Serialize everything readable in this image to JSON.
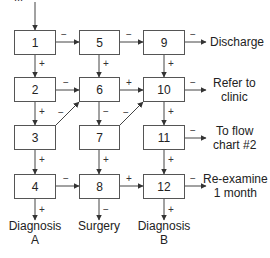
{
  "diagram": {
    "type": "flowchart",
    "top_text_partial": "...",
    "boxes": [
      {
        "id": "1",
        "label": "1"
      },
      {
        "id": "2",
        "label": "2"
      },
      {
        "id": "3",
        "label": "3"
      },
      {
        "id": "4",
        "label": "4"
      },
      {
        "id": "5",
        "label": "5"
      },
      {
        "id": "6",
        "label": "6"
      },
      {
        "id": "7",
        "label": "7"
      },
      {
        "id": "8",
        "label": "8"
      },
      {
        "id": "9",
        "label": "9"
      },
      {
        "id": "10",
        "label": "10"
      },
      {
        "id": "11",
        "label": "11"
      },
      {
        "id": "12",
        "label": "12"
      }
    ],
    "outcomes": {
      "discharge": "Discharge",
      "refer_line1": "Refer to",
      "refer_line2": "clinic",
      "flow_line1": "To flow",
      "flow_line2": "chart #2",
      "reexamine_line1": "Re-examine",
      "reexamine_line2": "1 month",
      "diag_a_line1": "Diagnosis",
      "diag_a_line2": "A",
      "surgery": "Surgery",
      "diag_b_line1": "Diagnosis",
      "diag_b_line2": "B"
    },
    "edges": [
      {
        "from": "start",
        "to": "1",
        "sign": ""
      },
      {
        "from": "1",
        "to": "5",
        "sign": "−"
      },
      {
        "from": "1",
        "to": "2",
        "sign": "+"
      },
      {
        "from": "5",
        "to": "9",
        "sign": "−"
      },
      {
        "from": "5",
        "to": "6",
        "sign": "+"
      },
      {
        "from": "9",
        "to": "Discharge",
        "sign": "−"
      },
      {
        "from": "9",
        "to": "10",
        "sign": "+"
      },
      {
        "from": "2",
        "to": "6",
        "sign": "−"
      },
      {
        "from": "2",
        "to": "3",
        "sign": "+"
      },
      {
        "from": "6",
        "to": "10",
        "sign": "+"
      },
      {
        "from": "6",
        "to": "7",
        "sign": "−"
      },
      {
        "from": "10",
        "to": "Refer to clinic",
        "sign": "−"
      },
      {
        "from": "10",
        "to": "11",
        "sign": "+"
      },
      {
        "from": "3",
        "to": "6",
        "sign": "−"
      },
      {
        "from": "3",
        "to": "4",
        "sign": "+"
      },
      {
        "from": "7",
        "to": "10",
        "sign": "−"
      },
      {
        "from": "7",
        "to": "8",
        "sign": "+"
      },
      {
        "from": "11",
        "to": "To flow chart #2",
        "sign": "−"
      },
      {
        "from": "11",
        "to": "12",
        "sign": "+"
      },
      {
        "from": "4",
        "to": "8",
        "sign": "−"
      },
      {
        "from": "4",
        "to": "Diagnosis A",
        "sign": "+"
      },
      {
        "from": "8",
        "to": "12",
        "sign": "+"
      },
      {
        "from": "8",
        "to": "Surgery",
        "sign": "−"
      },
      {
        "from": "12",
        "to": "Re-examine 1 month",
        "sign": "−"
      },
      {
        "from": "12",
        "to": "Diagnosis B",
        "sign": "+"
      }
    ],
    "signs": {
      "plus": "+",
      "minus": "−"
    }
  }
}
